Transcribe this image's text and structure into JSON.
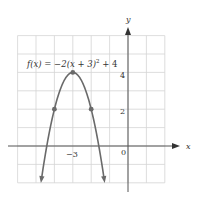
{
  "chart_data": {
    "type": "line",
    "function": "f(x) = -2(x + 3)^2 + 4",
    "xlabel": "x",
    "ylabel": "y",
    "xlim": [
      -6,
      2
    ],
    "ylim": [
      -2,
      6
    ],
    "grid": true,
    "x_tick_labels": [
      "−3",
      "0"
    ],
    "y_tick_labels": [
      "2",
      "4"
    ],
    "marked_points": [
      {
        "x": -4,
        "y": 2
      },
      {
        "x": -3,
        "y": 4
      },
      {
        "x": -2,
        "y": 2
      }
    ],
    "series": [
      {
        "name": "f(x) = −2(x + 3)² + 4",
        "x": [
          -4.7,
          -4.5,
          -4,
          -3.5,
          -3,
          -2.5,
          -2,
          -1.5,
          -1.3
        ],
        "y": [
          -1.78,
          -0.5,
          2,
          3.5,
          4,
          3.5,
          2,
          -0.5,
          -1.78
        ]
      }
    ],
    "vertex": {
      "x": -3,
      "y": 4
    }
  },
  "labels": {
    "equation_prefix": "f(x) = −2(x + 3)",
    "equation_exp": "2",
    "equation_suffix": " + 4",
    "x_axis": "x",
    "y_axis": "y",
    "tick_neg3": "−3",
    "tick_0": "0",
    "tick_2": "2",
    "tick_4": "4"
  }
}
